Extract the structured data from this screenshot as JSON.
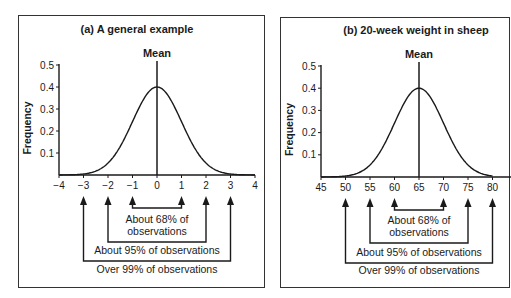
{
  "chart_data": [
    {
      "type": "line",
      "title": "(a) A general example",
      "xlabel": "",
      "ylabel": "Frequency",
      "mean_label": "Mean",
      "mean": 0,
      "sd": 1,
      "x_ticks": [
        -4,
        -3,
        -2,
        -1,
        0,
        1,
        2,
        3,
        4
      ],
      "x_tick_labels": [
        "−4",
        "−3",
        "−2",
        "−1",
        "0",
        "1",
        "2",
        "3",
        "4"
      ],
      "y_ticks": [
        0.1,
        0.2,
        0.3,
        0.4,
        0.5
      ],
      "y_tick_labels": [
        "0.1",
        "0.2",
        "0.3",
        "0.4",
        "0.5"
      ],
      "xlim": [
        -4,
        4
      ],
      "ylim": [
        0,
        0.5
      ],
      "grid": false,
      "series": [
        {
          "name": "Normal density",
          "curve": "normal(0,1)",
          "peak": 0.4
        }
      ],
      "annotations": [
        {
          "range": [
            -1,
            1
          ],
          "text_lines": [
            "About 68% of",
            "observations"
          ]
        },
        {
          "range": [
            -2,
            2
          ],
          "text_lines": [
            "About 95% of observations"
          ]
        },
        {
          "range": [
            -3,
            3
          ],
          "text_lines": [
            "Over 99% of observations"
          ]
        }
      ]
    },
    {
      "type": "line",
      "title": "(b) 20-week weight in sheep",
      "xlabel": "",
      "ylabel": "Frequency",
      "mean_label": "Mean",
      "mean": 65,
      "sd": 5,
      "x_ticks": [
        45,
        50,
        55,
        60,
        65,
        70,
        75,
        80
      ],
      "x_tick_labels": [
        "45",
        "50",
        "55",
        "60",
        "65",
        "70",
        "75",
        "80"
      ],
      "y_ticks": [
        0.1,
        0.2,
        0.3,
        0.4,
        0.5
      ],
      "y_tick_labels": [
        "0.1",
        "0.2",
        "0.3",
        "0.4",
        "0.5"
      ],
      "xlim": [
        45,
        85
      ],
      "ylim": [
        0,
        0.5
      ],
      "grid": false,
      "series": [
        {
          "name": "Normal density (scaled)",
          "curve": "normal(65,5)",
          "peak": 0.4
        }
      ],
      "annotations": [
        {
          "range": [
            60,
            70
          ],
          "text_lines": [
            "About 68% of",
            "observations"
          ]
        },
        {
          "range": [
            55,
            75
          ],
          "text_lines": [
            "About 95% of observations"
          ]
        },
        {
          "range": [
            50,
            80
          ],
          "text_lines": [
            "Over 99% of observations"
          ]
        }
      ]
    }
  ],
  "colors": {
    "ink": "#1a1a1a",
    "border": "#333333",
    "background": "#ffffff"
  }
}
